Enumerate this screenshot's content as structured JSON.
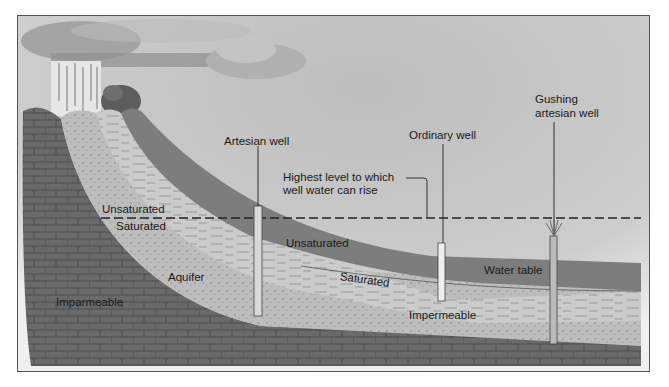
{
  "diagram": {
    "type": "artesian-aquifer-cross-section",
    "labels": {
      "artesian_well": "Artesian well",
      "ordinary_well": "Ordinary well",
      "gushing_line1": "Gushing",
      "gushing_line2": "artesian well",
      "highest_level_line1": "Highest level to which",
      "highest_level_line2": "well water can rise",
      "unsaturated_left": "Unsaturated",
      "saturated_left": "Saturated",
      "unsaturated_mid": "Unsaturated",
      "saturated_mid": "Saturated",
      "aquifer": "Aquifer",
      "impermeable_left": "Imparmeable",
      "impermeable_mid": "Impermeable",
      "water_table": "Water table"
    },
    "colors": {
      "sky": "#c8c8c8",
      "unsaturated": "#7d7d7d",
      "saturated": "#b9b9b9",
      "aquifer_band": "#cfcfcf",
      "impermeable": "#6a6a6a",
      "frame": "#555555",
      "text": "#1a1a1a"
    }
  }
}
